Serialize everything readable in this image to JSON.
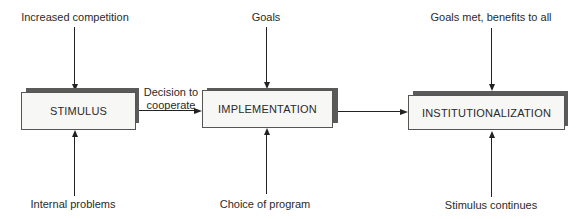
{
  "diagram": {
    "type": "process-flow",
    "stages": [
      {
        "label": "STIMULUS",
        "input_top": "Increased competition",
        "input_bottom": "Internal problems"
      },
      {
        "label": "IMPLEMENTATION",
        "input_top": "Goals",
        "input_bottom": "Choice of program"
      },
      {
        "label": "INSTITUTIONALIZATION",
        "input_top": "Goals met, benefits to all",
        "input_bottom": "Stimulus continues"
      }
    ],
    "connectors": [
      {
        "from": "STIMULUS",
        "to": "IMPLEMENTATION",
        "label_line1": "Decision to",
        "label_line2": "cooperate"
      },
      {
        "from": "IMPLEMENTATION",
        "to": "INSTITUTIONALIZATION",
        "label_line1": "",
        "label_line2": ""
      }
    ]
  },
  "colors": {
    "box_fill": "#f7f7f5",
    "box_shadow": "#5a5a5a",
    "line": "#222222"
  }
}
